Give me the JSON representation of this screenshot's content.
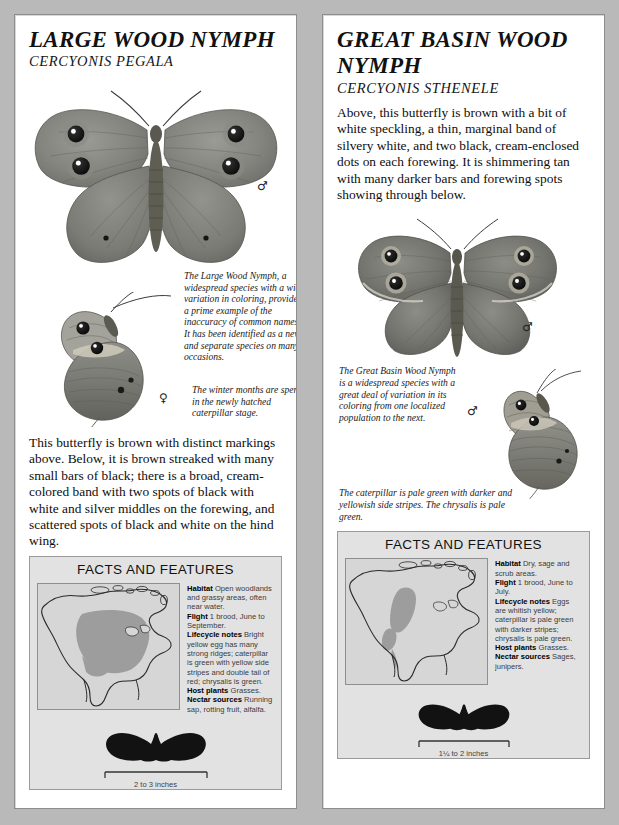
{
  "page": {
    "background_color": "#b9b9b9",
    "panel_background": "#ffffff",
    "facts_background": "#e2e2e2",
    "map_background": "#d6d6d6",
    "range_fill": "#9d9d9d"
  },
  "left_panel": {
    "common_name": "LARGE WOOD NYMPH",
    "scientific_name": "CERCYONIS PEGALA",
    "figure_top": {
      "sex_symbol": "♂",
      "view": "dorsal"
    },
    "caption_1": "The Large Wood Nymph, a widespread species with a wide variation in coloring, provides a prime example of the inaccuracy of common names. It has been identified as a new and separate species on many occasions.",
    "figure_bottom": {
      "sex_symbol": "♀",
      "view": "ventral"
    },
    "caption_2": "The winter months are spent in the newly hatched caterpillar stage.",
    "description": "This butterfly is brown with distinct markings above. Below, it is brown streaked with many small bars of black; there is a broad, cream-colored band with two spots of black with white and silver middles on the forewing, and scattered spots of black and white on the hind wing.",
    "facts": {
      "heading": "FACTS AND FEATURES",
      "entries": [
        {
          "label": "Habitat",
          "value": "Open woodlands and grassy areas, often near water."
        },
        {
          "label": "Flight",
          "value": "1 brood, June to September."
        },
        {
          "label": "Lifecycle notes",
          "value": "Bright yellow egg has many strong ridges; caterpillar is green with yellow side stripes and double tail of red; chrysalis is green."
        },
        {
          "label": "Host plants",
          "value": "Grasses."
        },
        {
          "label": "Nectar sources",
          "value": "Running sap, rotting fruit, alfalfa."
        }
      ],
      "map_alt": "north-america-range-map",
      "scale_label": "2 to 3 inches"
    }
  },
  "right_panel": {
    "common_name": "GREAT BASIN WOOD NYMPH",
    "scientific_name": "CERCYONIS STHENELE",
    "description": "Above, this butterfly is brown with a bit of white speckling, a thin, marginal band of silvery white, and two black, cream-enclosed dots on each forewing. It is shimmering tan with many darker bars and forewing spots showing through below.",
    "figure_top": {
      "sex_symbol": "♂",
      "view": "dorsal"
    },
    "caption_1": "The Great Basin Wood Nymph is a widespread species with a great deal of variation in its coloring from one localized population to the next.",
    "figure_bottom": {
      "sex_symbol": "♂",
      "view": "ventral"
    },
    "caption_2": "The caterpillar is pale green with darker and yellowish side stripes. The chrysalis is pale green.",
    "facts": {
      "heading": "FACTS AND FEATURES",
      "entries": [
        {
          "label": "Habitat",
          "value": "Dry, sage and scrub areas."
        },
        {
          "label": "Flight",
          "value": "1 brood, June to July."
        },
        {
          "label": "Lifecycle notes",
          "value": "Eggs are whitish yellow; caterpillar is pale green with darker stripes; chrysalis is pale green."
        },
        {
          "label": "Host plants",
          "value": "Grasses."
        },
        {
          "label": "Nectar sources",
          "value": "Sages, junipers."
        }
      ],
      "map_alt": "north-america-range-map",
      "scale_label": "1¼ to 2 inches"
    }
  }
}
